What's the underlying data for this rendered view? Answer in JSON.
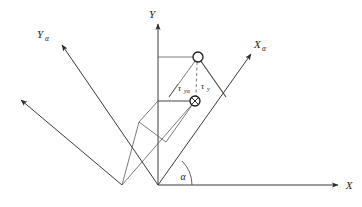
{
  "figure": {
    "width": 362,
    "height": 207,
    "background": "#ffffff",
    "line_color": "#3a3a3a",
    "construct_color": "#5a5a5a",
    "dash_color": "#8a8a8a",
    "marker_color": "#1a1a1a"
  },
  "axes": {
    "origin": {
      "x": 158,
      "y": 185
    },
    "x_axis": {
      "label": "X",
      "subscript": "",
      "tip": {
        "x": 340,
        "y": 185
      },
      "arrow": true
    },
    "y_axis": {
      "label": "Y",
      "subscript": "",
      "tip": {
        "x": 158,
        "y": 22
      },
      "arrow": true
    },
    "x_alpha_axis": {
      "label": "X",
      "subscript": "α",
      "tip": {
        "x": 253,
        "y": 52
      },
      "arrow": true
    },
    "y_alpha_axis": {
      "label": "Y",
      "subscript": "α",
      "tip": {
        "x": 58,
        "y": 42
      },
      "arrow": true
    },
    "y_alpha_parallel": {
      "tip": {
        "x": 17,
        "y": 98
      },
      "arrow": true
    }
  },
  "angle": {
    "label": "α",
    "value_deg": 45,
    "arc_radius": 30
  },
  "markers": [
    {
      "name": "upper-point",
      "x": 198,
      "y": 57,
      "radius": 5,
      "style": "open"
    },
    {
      "name": "lower-point",
      "x": 195,
      "y": 101,
      "radius": 5,
      "style": "crossed"
    }
  ],
  "stress_labels": [
    {
      "name": "tau-y-alpha",
      "symbol": "τ",
      "subscript": "yα",
      "x": 181,
      "y": 88
    },
    {
      "name": "tau-y",
      "symbol": "τ",
      "subscript": "y",
      "x": 203,
      "y": 86
    }
  ],
  "construction": {
    "upper_horizontal": {
      "x1": 158,
      "y1": 57,
      "x2": 198,
      "y2": 57
    },
    "lower_horizontal": {
      "x1": 158,
      "y1": 101,
      "x2": 195,
      "y2": 101
    },
    "dashed_vertical": {
      "x1": 198,
      "y1": 57,
      "x2": 196,
      "y2": 101
    }
  }
}
